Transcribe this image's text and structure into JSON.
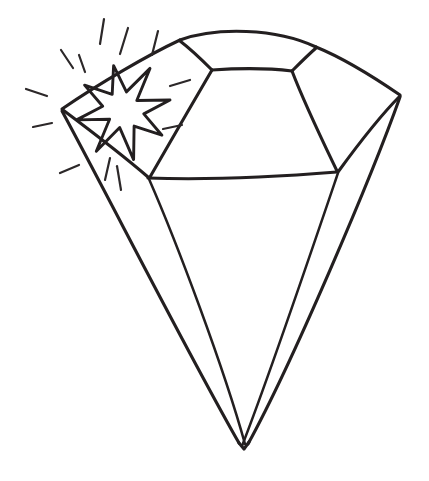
{
  "page": {
    "background_color": "#ffffff",
    "ink_color": "#231f20",
    "width": 429,
    "height": 481,
    "style": "hand-drawn black outline coloring-book illustration, no fill"
  },
  "artwork": {
    "name": "sparkling-diamond",
    "subject": "diamond",
    "description": "A hand-drawn outline of a cut gemstone seen from slightly above, with a flat table facet on top, a ring of crown facets, a horizontal girdle line, and a long pointed pavilion ending in a single sharp culet at the bottom. A multi-pointed sparkle star sits on the upper-left crown facet, surrounded by short radiating glint strokes.",
    "parts": [
      {
        "label": "table-facet",
        "note": "flat top hexagonal facet"
      },
      {
        "label": "crown-facets",
        "note": "upper angled facets around the table"
      },
      {
        "label": "girdle-line",
        "note": "horizontal widest line across the stone"
      },
      {
        "label": "pavilion",
        "note": "long tapering lower body"
      },
      {
        "label": "culet-point",
        "note": "sharp bottom tip"
      },
      {
        "label": "sparkle-star",
        "note": "eight-point starburst highlight"
      },
      {
        "label": "glint-rays",
        "note": "short radiating shine strokes"
      }
    ],
    "geometry": {
      "left_vertex": [
        62,
        110
      ],
      "right_vertex": [
        400,
        95
      ],
      "top_left_crown": [
        180,
        40
      ],
      "top_right_crown": [
        316,
        47
      ],
      "table_left": [
        212,
        70
      ],
      "table_right": [
        292,
        72
      ],
      "girdle_left": [
        148,
        178
      ],
      "girdle_right": [
        337,
        172
      ],
      "culet": [
        244,
        447
      ]
    },
    "sparkle": {
      "center": [
        123,
        110
      ],
      "points": 8,
      "outer_radius": 48,
      "inner_radius": 19,
      "rotation_deg": -12
    },
    "glint_rays": [
      {
        "x1": 104,
        "y1": 19,
        "x2": 100,
        "y2": 44
      },
      {
        "x1": 128,
        "y1": 28,
        "x2": 120,
        "y2": 54
      },
      {
        "x1": 158,
        "y1": 31,
        "x2": 152,
        "y2": 55
      },
      {
        "x1": 61,
        "y1": 50,
        "x2": 73,
        "y2": 68
      },
      {
        "x1": 79,
        "y1": 55,
        "x2": 85,
        "y2": 72
      },
      {
        "x1": 26,
        "y1": 89,
        "x2": 47,
        "y2": 96
      },
      {
        "x1": 33,
        "y1": 127,
        "x2": 52,
        "y2": 123
      },
      {
        "x1": 60,
        "y1": 173,
        "x2": 79,
        "y2": 165
      },
      {
        "x1": 105,
        "y1": 180,
        "x2": 110,
        "y2": 158
      },
      {
        "x1": 170,
        "y1": 86,
        "x2": 190,
        "y2": 80
      },
      {
        "x1": 163,
        "y1": 129,
        "x2": 182,
        "y2": 125
      },
      {
        "x1": 117,
        "y1": 166,
        "x2": 121,
        "y2": 190
      }
    ]
  },
  "tools": {
    "zoom_label": "Zoom",
    "zoom_value": "100%"
  }
}
